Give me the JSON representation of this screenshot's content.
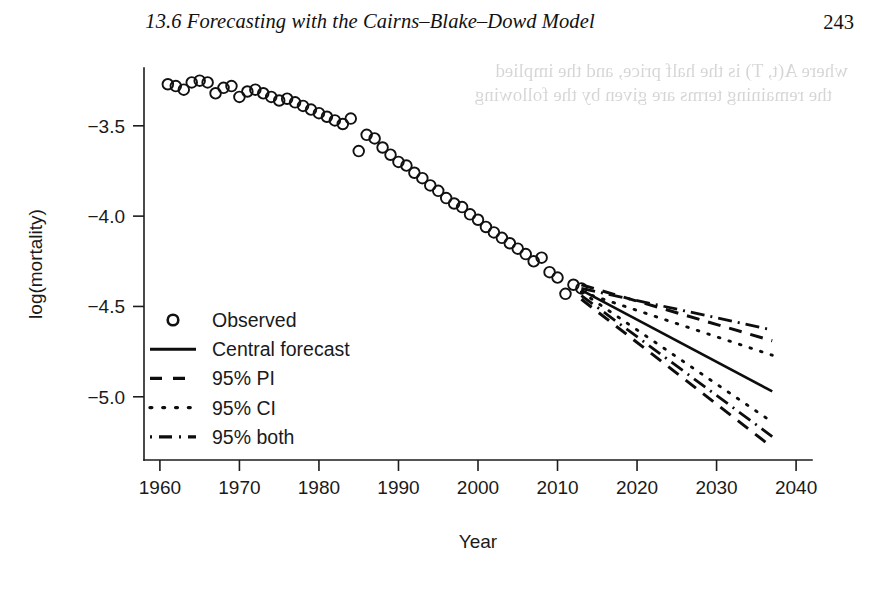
{
  "running_head": {
    "section_number": "13.6",
    "title": "13.6  Forecasting with the Cairns–Blake–Dowd Model",
    "page_number": "243"
  },
  "bleed_through": {
    "line1": "where A(t, T) is the half price, and the implied",
    "line2": "the remaining terms are given by the following"
  },
  "chart_data": {
    "type": "scatter",
    "title": "",
    "xlabel": "Year",
    "ylabel": "log(mortality)",
    "xlim": [
      1958,
      2042
    ],
    "ylim": [
      -5.35,
      -3.18
    ],
    "xticks": [
      1960,
      1970,
      1980,
      1990,
      2000,
      2010,
      2020,
      2030,
      2040
    ],
    "xticklabels": [
      "1960",
      "1970",
      "1980",
      "1990",
      "2000",
      "2010",
      "2020",
      "2030",
      "2040"
    ],
    "yticks": [
      -3.5,
      -4.0,
      -4.5,
      -5.0
    ],
    "yticklabels": [
      "−3.5",
      "−4.0",
      "−4.5",
      "−5.0"
    ],
    "grid": false,
    "legend_position": "left-middle",
    "legend": [
      {
        "label": "Observed",
        "style": "circle-marker"
      },
      {
        "label": "Central forecast",
        "style": "solid"
      },
      {
        "label": "95% PI",
        "style": "dashed"
      },
      {
        "label": "95% CI",
        "style": "dotted"
      },
      {
        "label": "95% both",
        "style": "dash-dot"
      }
    ],
    "series": [
      {
        "name": "Observed",
        "style": "circle-marker",
        "x": [
          1961,
          1962,
          1963,
          1964,
          1965,
          1966,
          1967,
          1968,
          1969,
          1970,
          1971,
          1972,
          1973,
          1974,
          1975,
          1976,
          1977,
          1978,
          1979,
          1980,
          1981,
          1982,
          1983,
          1984,
          1985,
          1986,
          1987,
          1988,
          1989,
          1990,
          1991,
          1992,
          1993,
          1994,
          1995,
          1996,
          1997,
          1998,
          1999,
          2000,
          2001,
          2002,
          2003,
          2004,
          2005,
          2006,
          2007,
          2008,
          2009,
          2010,
          2011,
          2012,
          2013
        ],
        "y": [
          -3.27,
          -3.28,
          -3.3,
          -3.26,
          -3.25,
          -3.26,
          -3.32,
          -3.29,
          -3.28,
          -3.34,
          -3.31,
          -3.3,
          -3.32,
          -3.34,
          -3.36,
          -3.35,
          -3.37,
          -3.39,
          -3.41,
          -3.43,
          -3.45,
          -3.47,
          -3.49,
          -3.46,
          -3.64,
          -3.55,
          -3.57,
          -3.62,
          -3.66,
          -3.7,
          -3.72,
          -3.76,
          -3.79,
          -3.83,
          -3.86,
          -3.9,
          -3.93,
          -3.95,
          -3.99,
          -4.02,
          -4.06,
          -4.09,
          -4.12,
          -4.15,
          -4.18,
          -4.21,
          -4.25,
          -4.23,
          -4.31,
          -4.34,
          -4.43,
          -4.38,
          -4.4
        ]
      },
      {
        "name": "Central forecast",
        "style": "solid",
        "x": [
          2013,
          2037
        ],
        "y": [
          -4.41,
          -4.97
        ]
      },
      {
        "name": "95% PI upper",
        "style": "dashed",
        "x": [
          2013,
          2037
        ],
        "y": [
          -4.38,
          -4.69
        ]
      },
      {
        "name": "95% PI lower",
        "style": "dashed",
        "x": [
          2013,
          2037
        ],
        "y": [
          -4.46,
          -5.28
        ]
      },
      {
        "name": "95% CI upper",
        "style": "dotted",
        "x": [
          2013,
          2037
        ],
        "y": [
          -4.42,
          -4.77
        ]
      },
      {
        "name": "95% CI lower",
        "style": "dotted",
        "x": [
          2013,
          2037
        ],
        "y": [
          -4.42,
          -5.14
        ]
      },
      {
        "name": "95% both upper",
        "style": "dash-dot",
        "x": [
          2013,
          2037
        ],
        "y": [
          -4.4,
          -4.63
        ]
      },
      {
        "name": "95% both lower",
        "style": "dash-dot",
        "x": [
          2013,
          2037
        ],
        "y": [
          -4.44,
          -5.22
        ]
      }
    ]
  }
}
